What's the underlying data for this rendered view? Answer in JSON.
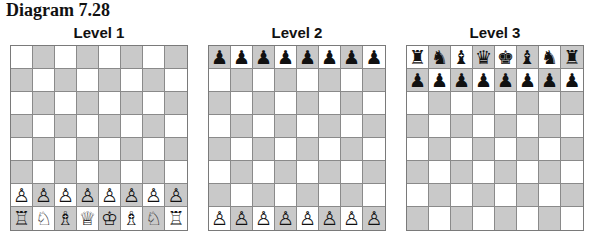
{
  "title": "Diagram 7.28",
  "colors": {
    "light": "#ffffff",
    "dark": "#c9c9c9",
    "grid": "#8a8a8a"
  },
  "boards": [
    {
      "label": "Level 1",
      "first_square_dark": false,
      "rows": [
        [
          "",
          "",
          "",
          "",
          "",
          "",
          "",
          ""
        ],
        [
          "",
          "",
          "",
          "",
          "",
          "",
          "",
          ""
        ],
        [
          "",
          "",
          "",
          "",
          "",
          "",
          "",
          ""
        ],
        [
          "",
          "",
          "",
          "",
          "",
          "",
          "",
          ""
        ],
        [
          "",
          "",
          "",
          "",
          "",
          "",
          "",
          ""
        ],
        [
          "",
          "",
          "",
          "",
          "",
          "",
          "",
          ""
        ],
        [
          "♙",
          "♙",
          "♙",
          "♙",
          "♙",
          "♙",
          "♙",
          "♙"
        ],
        [
          "♖",
          "♘",
          "♗",
          "♕",
          "♔",
          "♗",
          "♘",
          "♖"
        ]
      ]
    },
    {
      "label": "Level 2",
      "first_square_dark": true,
      "rows": [
        [
          "♟",
          "♟",
          "♟",
          "♟",
          "♟",
          "♟",
          "♟",
          "♟"
        ],
        [
          "",
          "",
          "",
          "",
          "",
          "",
          "",
          ""
        ],
        [
          "",
          "",
          "",
          "",
          "",
          "",
          "",
          ""
        ],
        [
          "",
          "",
          "",
          "",
          "",
          "",
          "",
          ""
        ],
        [
          "",
          "",
          "",
          "",
          "",
          "",
          "",
          ""
        ],
        [
          "",
          "",
          "",
          "",
          "",
          "",
          "",
          ""
        ],
        [
          "",
          "",
          "",
          "",
          "",
          "",
          "",
          ""
        ],
        [
          "♙",
          "♙",
          "♙",
          "♙",
          "♙",
          "♙",
          "♙",
          "♙"
        ]
      ]
    },
    {
      "label": "Level 3",
      "first_square_dark": false,
      "rows": [
        [
          "♜",
          "♞",
          "♝",
          "♛",
          "♚",
          "♝",
          "♞",
          "♜"
        ],
        [
          "♟",
          "♟",
          "♟",
          "♟",
          "♟",
          "♟",
          "♟",
          "♟"
        ],
        [
          "",
          "",
          "",
          "",
          "",
          "",
          "",
          ""
        ],
        [
          "",
          "",
          "",
          "",
          "",
          "",
          "",
          ""
        ],
        [
          "",
          "",
          "",
          "",
          "",
          "",
          "",
          ""
        ],
        [
          "",
          "",
          "",
          "",
          "",
          "",
          "",
          ""
        ],
        [
          "",
          "",
          "",
          "",
          "",
          "",
          "",
          ""
        ],
        [
          "",
          "",
          "",
          "",
          "",
          "",
          "",
          ""
        ]
      ]
    }
  ]
}
